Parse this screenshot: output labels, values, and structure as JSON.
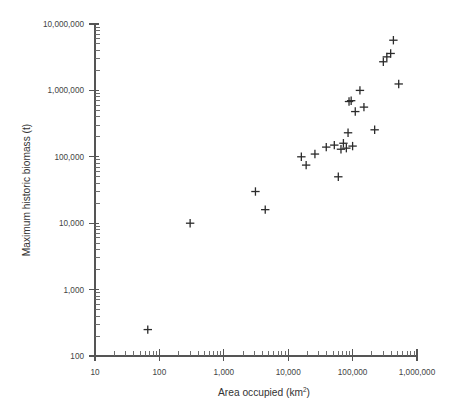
{
  "chart_data": {
    "type": "scatter",
    "title": "",
    "xlabel": "Area occupied (km2)",
    "xlabel_base": "Area occupied (km",
    "xlabel_sup": "2",
    "xlabel_close": ")",
    "ylabel": "Maximum historic biomass (t)",
    "xscale": "log",
    "yscale": "log",
    "xlim": [
      10,
      1000000
    ],
    "ylim": [
      100,
      10000000
    ],
    "grid": false,
    "legend": false,
    "marker_style": "plus",
    "marker_color": "#2b2b2b",
    "xticks": [
      10,
      100,
      1000,
      10000,
      100000,
      1000000
    ],
    "xtick_labels": [
      "10",
      "100",
      "1,000",
      "10,000",
      "100,000",
      "1,000,000"
    ],
    "yticks": [
      100,
      1000,
      10000,
      100000,
      1000000,
      10000000
    ],
    "ytick_labels": [
      "100",
      "1,000",
      "10,000",
      "100,000",
      "1,000,000",
      "10,000,000"
    ],
    "x": [
      66,
      300,
      3100,
      4400,
      16000,
      19000,
      26000,
      39000,
      52000,
      60000,
      66000,
      72000,
      80000,
      85000,
      88000,
      95000,
      100000,
      110000,
      130000,
      150000,
      220000,
      300000,
      340000,
      390000,
      430000,
      520000
    ],
    "y": [
      250,
      10000,
      30000,
      16000,
      100000,
      75000,
      110000,
      140000,
      150000,
      50000,
      130000,
      160000,
      135000,
      230000,
      680000,
      700000,
      145000,
      480000,
      1000000,
      560000,
      255000,
      2700000,
      3200000,
      3600000,
      5700000,
      1250000
    ],
    "n_points": 26,
    "series_name": "species",
    "axis_color": "#555555",
    "text_color": "#333333"
  }
}
